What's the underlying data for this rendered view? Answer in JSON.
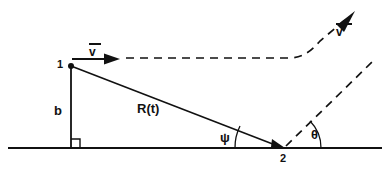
{
  "figure": {
    "type": "geometry-diagram",
    "background_color": "#ffffff",
    "stroke_color": "#111111",
    "width": 392,
    "height": 172
  },
  "labels": {
    "point_1": "1",
    "point_2": "2",
    "baseline_b": "b",
    "range": "R(t)",
    "angle_psi": "ψ",
    "angle_theta": "θ",
    "velocity": "v",
    "velocity_prime": "v'"
  },
  "geometry": {
    "point_1": {
      "x": 71,
      "y": 66
    },
    "point_2": {
      "x": 283,
      "y": 148
    },
    "foot_of_perpendicular": {
      "x": 71,
      "y": 148
    },
    "ground_line": {
      "x1": 8,
      "y1": 148,
      "x2": 382,
      "y2": 148
    },
    "range_line": {
      "x1": 71,
      "y1": 66,
      "x2": 283,
      "y2": 148
    },
    "altitude_line": {
      "x1": 71,
      "y1": 66,
      "x2": 71,
      "y2": 148
    },
    "velocity_arrow": {
      "x1": 71,
      "y1": 60,
      "x2": 120,
      "y2": 60
    },
    "trajectory_dashed": "from (125,58) horizontal to (290,58) then curving up-right to (350,16)",
    "velocity_prime_arrow_tip": {
      "x": 353,
      "y": 14
    },
    "theta_ray_dashed": {
      "x1": 283,
      "y1": 148,
      "x2": 372,
      "y2": 62
    },
    "psi_arc_radius": 48,
    "theta_arc_radius": 38,
    "right_angle_marker": {
      "x": 71,
      "y": 148,
      "size": 9
    }
  },
  "elements": {
    "ground_line_name": "ground-reference-line",
    "range_line_name": "range-vector-line",
    "altitude_line_name": "altitude-segment"
  }
}
